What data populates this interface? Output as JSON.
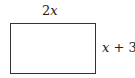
{
  "diagram": {
    "shape": "rectangle",
    "width_label": {
      "coef": "2",
      "var": "x"
    },
    "height_label": {
      "var": "x",
      "rest": " + 3"
    },
    "stroke_color": "#333333",
    "text_color": "#222222"
  }
}
